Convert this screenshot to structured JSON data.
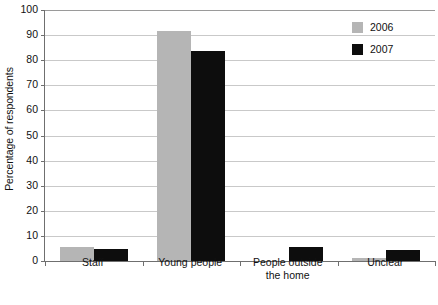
{
  "chart_data": {
    "type": "bar",
    "title": "",
    "xlabel": "",
    "ylabel": "Percentage of respondents",
    "ylim": [
      0,
      100
    ],
    "ytick_step": 10,
    "yticks": [
      100,
      90,
      80,
      70,
      60,
      50,
      40,
      30,
      20,
      10,
      0
    ],
    "grid": true,
    "legend_position": "top-right",
    "categories": [
      "Staff",
      "Young people",
      "People outside\nthe home",
      "Unclear"
    ],
    "category_labels": [
      [
        "Staff"
      ],
      [
        "Young people"
      ],
      [
        "People outside",
        "the home"
      ],
      [
        "Unclear"
      ]
    ],
    "series": [
      {
        "name": "2006",
        "color": "#b5b5b5",
        "values": [
          5.7,
          91.5,
          0,
          1.1
        ]
      },
      {
        "name": "2007",
        "color": "#0d0d0d",
        "values": [
          4.9,
          83.5,
          5.6,
          4.5
        ]
      }
    ]
  },
  "legend": {
    "items": [
      {
        "label": "2006",
        "color": "#b5b5b5"
      },
      {
        "label": "2007",
        "color": "#0d0d0d"
      }
    ]
  },
  "axes": {
    "y_title": "Percentage of respondents"
  },
  "title_strip": ""
}
